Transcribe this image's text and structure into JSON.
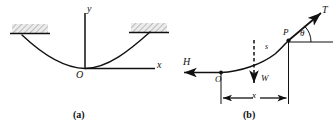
{
  "figure": {
    "panels": [
      {
        "caption": "(a)",
        "description": "cable hanging between two fixed supports with xy axes at lowest point",
        "labels": {
          "y_axis": "y",
          "x_axis": "x",
          "origin": "O"
        },
        "supports": {
          "left": "hatched-support-block",
          "right": "hatched-support-block"
        }
      },
      {
        "caption": "(b)",
        "description": "free body diagram of cable segment from O to P",
        "labels": {
          "origin": "O",
          "point_p": "P",
          "tension": "T",
          "horizontal_force": "H",
          "weight": "W",
          "arc_length": "s",
          "angle": "θ",
          "horizontal_distance": "x"
        }
      }
    ]
  },
  "colors": {
    "ink": "#111111",
    "hatch_fill": "#e8e8e8",
    "background": "#ffffff"
  }
}
